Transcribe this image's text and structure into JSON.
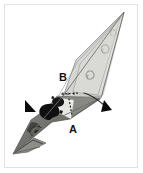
{
  "figure": {
    "caption_labels": [
      {
        "id": "A",
        "text": "A",
        "x": 69,
        "y": 124
      },
      {
        "id": "B",
        "text": "B",
        "x": 59,
        "y": 72
      }
    ],
    "markers": [
      {
        "name": "arrowhead-left",
        "text": "▶",
        "x": 26,
        "y": 101,
        "rotation": 0
      },
      {
        "name": "arrowhead-right",
        "text": "▶",
        "x": 102,
        "y": 100,
        "rotation": 28
      }
    ],
    "frame": {
      "border_color": "#e2e2e2",
      "background": "#ffffff"
    },
    "palette": {
      "specimen_light": "#d6d6d3",
      "specimen_mid": "#9a9a96",
      "specimen_dark": "#3a3a38",
      "specimen_black": "#0f0f0f",
      "specimen_white": "#f4f4f2",
      "outline": "#5a5a57",
      "marker": "#0a0a0a",
      "label": "#141414"
    },
    "geometry": {
      "tip_upper_right": {
        "x": 124,
        "y": 12
      },
      "tip_lower_left": {
        "x": 13,
        "y": 154
      },
      "long_axis_angle_deg": -52
    },
    "annotations": {
      "dotted_line": {
        "from_x": 62,
        "from_y": 94,
        "to_x": 80,
        "to_y": 93,
        "style": "dotted"
      },
      "leader_curve": {
        "from_x": 85,
        "from_y": 93,
        "to_x": 103,
        "to_y": 105,
        "style": "curved"
      },
      "dashed_segment": {
        "from_x": 69,
        "from_y": 98,
        "to_x": 71,
        "to_y": 116,
        "style": "dashed"
      }
    }
  }
}
